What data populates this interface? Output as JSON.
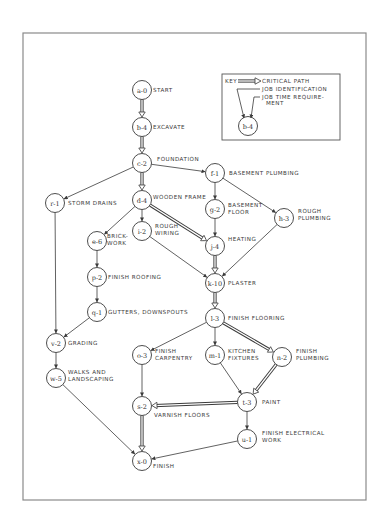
{
  "diagram": {
    "type": "critical-path-network",
    "frame": {
      "x": 23,
      "y": 33,
      "width": 343,
      "height": 467
    },
    "key": {
      "box": {
        "x": 222,
        "y": 74,
        "width": 118,
        "height": 66
      },
      "title": "KEY",
      "critical_path_label": "CRITICAL PATH",
      "job_identification_label": "JOB IDENTIFICATION",
      "job_time_label_line1": "JOB TIME REQUIRE-",
      "job_time_label_line2": "MENT",
      "example_node": "b-4"
    },
    "nodes": [
      {
        "id": "a",
        "text": "a-0",
        "time": 0,
        "x": 142,
        "y": 90,
        "label": [
          "START"
        ],
        "lx": 153,
        "ly": 92
      },
      {
        "id": "b",
        "text": "b-4",
        "time": 4,
        "x": 142,
        "y": 127,
        "label": [
          "EXCAVATE"
        ],
        "lx": 153,
        "ly": 129
      },
      {
        "id": "c",
        "text": "c-2",
        "time": 2,
        "x": 142,
        "y": 163,
        "label": [
          "FOUNDATION"
        ],
        "lx": 157,
        "ly": 161
      },
      {
        "id": "f",
        "text": "f-1",
        "time": 1,
        "x": 215,
        "y": 173,
        "label": [
          "BASEMENT PLUMBING"
        ],
        "lx": 229,
        "ly": 175
      },
      {
        "id": "r",
        "text": "r-1",
        "time": 1,
        "x": 55,
        "y": 203,
        "label": [
          "STORM DRAINS"
        ],
        "lx": 68,
        "ly": 205
      },
      {
        "id": "d",
        "text": "d-4",
        "time": 4,
        "x": 142,
        "y": 200,
        "label": [
          "WOODEN FRAME"
        ],
        "lx": 153,
        "ly": 199
      },
      {
        "id": "g",
        "text": "g-2",
        "time": 2,
        "x": 215,
        "y": 209,
        "label": [
          "BASEMENT",
          "FLOOR"
        ],
        "lx": 228,
        "ly": 207
      },
      {
        "id": "h",
        "text": "h-3",
        "time": 3,
        "x": 284,
        "y": 218,
        "label": [
          "ROUGH",
          "PLUMBING"
        ],
        "lx": 298,
        "ly": 213
      },
      {
        "id": "e",
        "text": "e-6",
        "time": 6,
        "x": 97,
        "y": 241,
        "label": [
          "BRICK-",
          "WORK"
        ],
        "lx": 107,
        "ly": 238
      },
      {
        "id": "i",
        "text": "i-2",
        "time": 2,
        "x": 142,
        "y": 231,
        "label": [
          "ROUGH",
          "WIRING"
        ],
        "lx": 155,
        "ly": 228
      },
      {
        "id": "j",
        "text": "j-4",
        "time": 4,
        "x": 215,
        "y": 246,
        "label": [
          "HEATING"
        ],
        "lx": 228,
        "ly": 241
      },
      {
        "id": "k",
        "text": "k-10",
        "time": 10,
        "x": 215,
        "y": 283,
        "label": [
          "PLASTER"
        ],
        "lx": 228,
        "ly": 285
      },
      {
        "id": "p",
        "text": "p-2",
        "time": 2,
        "x": 97,
        "y": 277,
        "label": [
          "FINISH ROOFING"
        ],
        "lx": 108,
        "ly": 279
      },
      {
        "id": "q",
        "text": "q-1",
        "time": 1,
        "x": 97,
        "y": 312,
        "label": [
          "GUTTERS, DOWNSPOUTS"
        ],
        "lx": 108,
        "ly": 314
      },
      {
        "id": "l",
        "text": "l-3",
        "time": 3,
        "x": 215,
        "y": 318,
        "label": [
          "FINISH FLOORING"
        ],
        "lx": 228,
        "ly": 320
      },
      {
        "id": "v",
        "text": "v-2",
        "time": 2,
        "x": 56,
        "y": 343,
        "label": [
          "GRADING"
        ],
        "lx": 68,
        "ly": 345
      },
      {
        "id": "o",
        "text": "o-3",
        "time": 3,
        "x": 142,
        "y": 355,
        "label": [
          "FINISH",
          "CARPENTRY"
        ],
        "lx": 155,
        "ly": 353
      },
      {
        "id": "m",
        "text": "m-1",
        "time": 1,
        "x": 215,
        "y": 355,
        "label": [
          "KITCHEN",
          "FIXTURES"
        ],
        "lx": 228,
        "ly": 353
      },
      {
        "id": "n",
        "text": "n-2",
        "time": 2,
        "x": 282,
        "y": 357,
        "label": [
          "FINISH",
          "PLUMBING"
        ],
        "lx": 296,
        "ly": 353
      },
      {
        "id": "w",
        "text": "w-5",
        "time": 5,
        "x": 56,
        "y": 378,
        "label": [
          "WALKS AND",
          "LANDSCAPING"
        ],
        "lx": 68,
        "ly": 374
      },
      {
        "id": "s",
        "text": "s-2",
        "time": 2,
        "x": 142,
        "y": 406,
        "label": [
          "VARNISH FLOORS"
        ],
        "lx": 154,
        "ly": 417
      },
      {
        "id": "t",
        "text": "t-3",
        "time": 3,
        "x": 247,
        "y": 402,
        "label": [
          "PAINT"
        ],
        "lx": 262,
        "ly": 404
      },
      {
        "id": "u",
        "text": "u-1",
        "time": 1,
        "x": 247,
        "y": 439,
        "label": [
          "FINISH ELECTRICAL",
          "WORK"
        ],
        "lx": 262,
        "ly": 435
      },
      {
        "id": "x",
        "text": "x-0",
        "time": 0,
        "x": 142,
        "y": 461,
        "label": [
          "FINISH"
        ],
        "lx": 153,
        "ly": 468
      }
    ],
    "edges": [
      {
        "from": "a",
        "to": "b",
        "critical": true
      },
      {
        "from": "b",
        "to": "c",
        "critical": true
      },
      {
        "from": "c",
        "to": "d",
        "critical": true
      },
      {
        "from": "c",
        "to": "f",
        "critical": false
      },
      {
        "from": "c",
        "to": "r",
        "critical": false
      },
      {
        "from": "f",
        "to": "g",
        "critical": false
      },
      {
        "from": "f",
        "to": "h",
        "critical": false
      },
      {
        "from": "d",
        "to": "e",
        "critical": false
      },
      {
        "from": "d",
        "to": "i",
        "critical": false
      },
      {
        "from": "d",
        "to": "j",
        "critical": true
      },
      {
        "from": "g",
        "to": "j",
        "critical": false
      },
      {
        "from": "h",
        "to": "k",
        "critical": false
      },
      {
        "from": "i",
        "to": "k",
        "critical": false
      },
      {
        "from": "j",
        "to": "k",
        "critical": true
      },
      {
        "from": "e",
        "to": "p",
        "critical": false
      },
      {
        "from": "p",
        "to": "q",
        "critical": false
      },
      {
        "from": "q",
        "to": "v",
        "critical": false
      },
      {
        "from": "r",
        "to": "v",
        "critical": false
      },
      {
        "from": "v",
        "to": "w",
        "critical": false
      },
      {
        "from": "k",
        "to": "l",
        "critical": true
      },
      {
        "from": "l",
        "to": "o",
        "critical": false
      },
      {
        "from": "l",
        "to": "m",
        "critical": false
      },
      {
        "from": "l",
        "to": "n",
        "critical": true
      },
      {
        "from": "o",
        "to": "s",
        "critical": false
      },
      {
        "from": "m",
        "to": "t",
        "critical": false
      },
      {
        "from": "n",
        "to": "t",
        "critical": true
      },
      {
        "from": "t",
        "to": "s",
        "critical": true
      },
      {
        "from": "t",
        "to": "u",
        "critical": false
      },
      {
        "from": "s",
        "to": "x",
        "critical": true
      },
      {
        "from": "w",
        "to": "x",
        "critical": false
      },
      {
        "from": "u",
        "to": "x",
        "critical": false
      }
    ]
  }
}
